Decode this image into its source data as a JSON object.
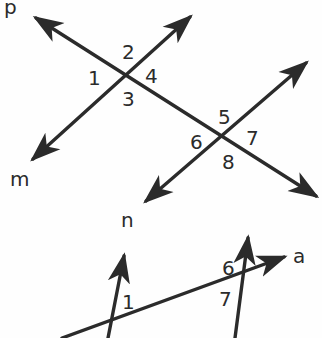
{
  "figure": {
    "stroke_color": "#2b2b2b",
    "background_color": "#fefefe",
    "width": 322,
    "height": 338
  },
  "top_figure": {
    "line_labels": [
      {
        "name": "p",
        "text": "p",
        "x": 4,
        "y": 0
      },
      {
        "name": "m",
        "text": "m",
        "x": 10,
        "y": 169
      },
      {
        "name": "n",
        "text": "n",
        "x": 121,
        "y": 210
      }
    ],
    "angle_labels": [
      {
        "id": "1",
        "text": "1",
        "x": 88,
        "y": 68
      },
      {
        "id": "2",
        "text": "2",
        "x": 122,
        "y": 42
      },
      {
        "id": "3",
        "text": "3",
        "x": 122,
        "y": 89
      },
      {
        "id": "4",
        "text": "4",
        "x": 145,
        "y": 66
      },
      {
        "id": "5",
        "text": "5",
        "x": 218,
        "y": 107
      },
      {
        "id": "6",
        "text": "6",
        "x": 190,
        "y": 132
      },
      {
        "id": "7",
        "text": "7",
        "x": 246,
        "y": 128
      },
      {
        "id": "8",
        "text": "8",
        "x": 222,
        "y": 152
      }
    ],
    "intersections": [
      {
        "name": "upper-left-vertex",
        "x": 126,
        "y": 75
      },
      {
        "name": "lower-right-vertex",
        "x": 228,
        "y": 138
      }
    ]
  },
  "bottom_figure": {
    "line_labels": [
      {
        "name": "a",
        "text": "a",
        "x": 293,
        "y": 246
      }
    ],
    "angle_labels": [
      {
        "id": "1",
        "text": "1",
        "x": 122,
        "y": 292
      },
      {
        "id": "6",
        "text": "6",
        "x": 222,
        "y": 258
      },
      {
        "id": "7",
        "text": "7",
        "x": 219,
        "y": 289
      }
    ],
    "intersections": [
      {
        "name": "left-vertex",
        "x": 112,
        "y": 328
      },
      {
        "name": "right-vertex",
        "x": 243,
        "y": 276
      }
    ]
  }
}
